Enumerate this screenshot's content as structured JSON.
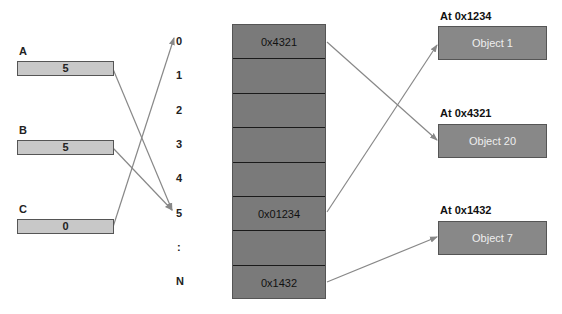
{
  "variables": [
    {
      "name": "A",
      "value": "5"
    },
    {
      "name": "B",
      "value": "5"
    },
    {
      "name": "C",
      "value": "0"
    }
  ],
  "indices": [
    "0",
    "1",
    "2",
    "3",
    "4",
    "5",
    ":",
    "N"
  ],
  "table_rows": [
    "0x4321",
    "",
    "",
    "",
    "",
    "0x01234",
    "",
    "0x1432"
  ],
  "objects": [
    {
      "label": "At 0x1234",
      "name": "Object 1"
    },
    {
      "label": "At 0x4321",
      "name": "Object 20"
    },
    {
      "label": "At 0x1432",
      "name": "Object 7"
    }
  ],
  "colors": {
    "var_fill": "#c8c8c8",
    "table_fill": "#7a7a7a",
    "object_fill": "#888888",
    "arrow": "#888888"
  }
}
